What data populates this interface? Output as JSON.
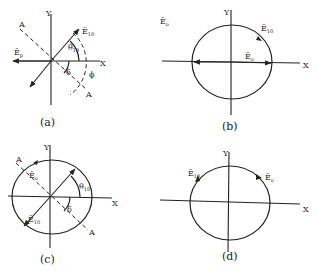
{
  "panels": [
    {
      "id": "a",
      "caption": "(a)",
      "axis_x": "X",
      "axis_y": "Y",
      "labels": {
        "e_p": "Ē",
        "e_p_sub": "p",
        "e_10": "Ē",
        "e_10_sub": "10",
        "theta": "θ",
        "theta_sub": "10",
        "delta": "δ",
        "phi": "ϕ",
        "a_top": "A",
        "a_bottom": "A"
      }
    },
    {
      "id": "b",
      "caption": "(b)",
      "axis_x": "X",
      "axis_y": "Y",
      "labels": {
        "e_o_corner": "Ē",
        "e_o_corner_sub": "o",
        "e_10": "Ē",
        "e_10_sub": "10",
        "e_o": "Ē",
        "e_o_sub": "o"
      }
    },
    {
      "id": "c",
      "caption": "(c)",
      "axis_x": "X",
      "axis_y": "Y",
      "labels": {
        "e_o": "Ē",
        "e_o_sub": "o",
        "e_10": "Ē",
        "e_10_sub": "10",
        "theta": "θ",
        "theta_sub": "10",
        "delta": "δ",
        "a_top": "A",
        "a_bottom": "A"
      }
    },
    {
      "id": "d",
      "caption": "(d)",
      "axis_x": "X",
      "axis_y": "Y",
      "labels": {
        "e_10": "Ē",
        "e_10_sub": "10",
        "e_o": "Ē",
        "e_o_sub": "o"
      }
    }
  ]
}
